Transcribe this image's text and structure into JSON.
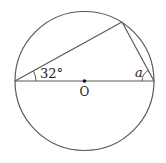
{
  "diagram": {
    "center_label": "O",
    "angle_left_label": "32°",
    "angle_right_label": "a",
    "angle_left_degrees": 32,
    "stroke_color": "#555555",
    "point_color": "#111111"
  }
}
